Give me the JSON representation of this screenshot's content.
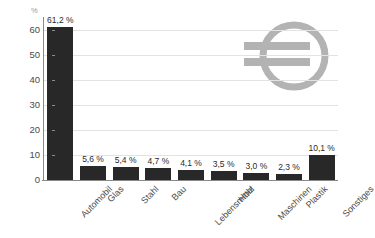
{
  "chart_data": {
    "type": "bar",
    "title": "",
    "subtitle": "",
    "xlabel": "",
    "ylabel": "",
    "yunit": "%",
    "ylim": [
      0,
      65
    ],
    "yticks": [
      0,
      10,
      20,
      30,
      40,
      50,
      60
    ],
    "ytick_labels": [
      "0",
      "10",
      "20",
      "30",
      "40",
      "50",
      "60"
    ],
    "grid": true,
    "grid_axis": "y",
    "legend": false,
    "categories": [
      "Automobil",
      "Glas",
      "Stahl",
      "Bau",
      "Lebensmittel",
      "Holz",
      "Maschinen",
      "Plastik",
      "Sonstiges"
    ],
    "values": [
      61.2,
      5.6,
      5.4,
      4.7,
      4.1,
      3.5,
      3.0,
      2.3,
      10.1
    ],
    "value_labels": [
      "61,2 %",
      "5,6 %",
      "5,4 %",
      "4,7 %",
      "4,1 %",
      "3,5 %",
      "3,0 %",
      "2,3 %",
      "10,1 %"
    ],
    "bar_color": "#282828",
    "grid_color": "#e3e3e3",
    "axis_color": "#8a8a8a",
    "background_color": "#ffffff"
  },
  "watermark": {
    "icon": "euro-currency-icon",
    "color": "#b3b3b3"
  }
}
